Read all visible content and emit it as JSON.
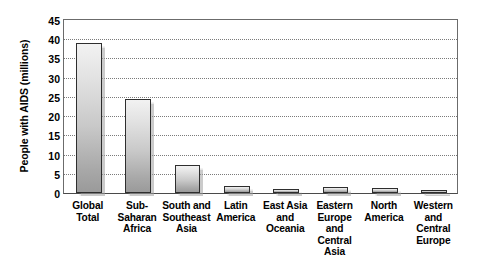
{
  "chart_data": {
    "type": "bar",
    "title": "",
    "xlabel": "",
    "ylabel": "People with AIDS (millions)",
    "ylim": [
      0,
      45
    ],
    "ytick_step": 5,
    "yticks": [
      "45",
      "40",
      "35",
      "30",
      "25",
      "20",
      "15",
      "10",
      "5",
      "0"
    ],
    "grid": true,
    "legend": false,
    "categories": [
      "Global Total",
      "Sub-Saharan Africa",
      "South and Southeast Asia",
      "Latin America",
      "East Asia and Oceania",
      "Eastern Europe and Central Asia",
      "North America",
      "Western and Central Europe"
    ],
    "category_lines": [
      [
        "Global",
        "Total"
      ],
      [
        "Sub-",
        "Saharan",
        "Africa"
      ],
      [
        "South and",
        "Southeast",
        "Asia"
      ],
      [
        "Latin",
        "America"
      ],
      [
        "East Asia",
        "and",
        "Oceania"
      ],
      [
        "Eastern",
        "Europe",
        "and",
        "Central Asia"
      ],
      [
        "North",
        "America"
      ],
      [
        "Western",
        "and",
        "Central",
        "Europe"
      ]
    ],
    "values": [
      39.0,
      24.5,
      7.4,
      1.7,
      1.0,
      1.5,
      1.2,
      0.7
    ]
  },
  "style": {
    "bar_outline": "#2e2e2e",
    "bar_fill_top": "#f2f2f2",
    "bar_fill_bottom": "#9a9a9a",
    "axis_color": "#6b6b6b",
    "grid_color": "#7a7a7a",
    "text_color": "#000000"
  }
}
